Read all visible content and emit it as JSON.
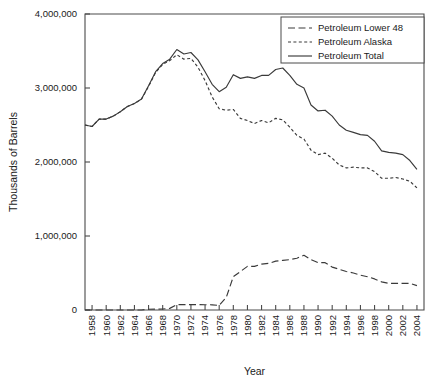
{
  "chart_data": {
    "type": "line",
    "title": "",
    "xlabel": "Year",
    "ylabel": "Thousands of Barrels",
    "xlim": [
      1957,
      2005
    ],
    "ylim": [
      0,
      4000000
    ],
    "grid": false,
    "legend_position": "top-right",
    "ytick_labels": [
      "0",
      "1,000,000",
      "2,000,000",
      "3,000,000",
      "4,000,000"
    ],
    "ytick_values": [
      0,
      1000000,
      2000000,
      3000000,
      4000000
    ],
    "xtick_labels": [
      "1958",
      "1960",
      "1962",
      "1964",
      "1966",
      "1968",
      "1970",
      "1972",
      "1974",
      "1976",
      "1978",
      "1980",
      "1982",
      "1984",
      "1986",
      "1988",
      "1990",
      "1992",
      "1994",
      "1996",
      "1998",
      "2000",
      "2002",
      "2004"
    ],
    "xtick_values": [
      1958,
      1960,
      1962,
      1964,
      1966,
      1968,
      1970,
      1972,
      1974,
      1976,
      1978,
      1980,
      1982,
      1984,
      1986,
      1988,
      1990,
      1992,
      1994,
      1996,
      1998,
      2000,
      2002,
      2004
    ],
    "x": [
      1957,
      1958,
      1959,
      1960,
      1961,
      1962,
      1963,
      1964,
      1965,
      1966,
      1967,
      1968,
      1969,
      1970,
      1971,
      1972,
      1973,
      1974,
      1975,
      1976,
      1977,
      1978,
      1979,
      1980,
      1981,
      1982,
      1983,
      1984,
      1985,
      1986,
      1987,
      1988,
      1989,
      1990,
      1991,
      1992,
      1993,
      1994,
      1995,
      1996,
      1997,
      1998,
      1999,
      2000,
      2001,
      2002,
      2003,
      2004
    ],
    "series": [
      {
        "name": "Petroleum Total",
        "dash": "solid",
        "values": [
          2500000,
          2480000,
          2580000,
          2580000,
          2620000,
          2680000,
          2750000,
          2790000,
          2850000,
          3030000,
          3220000,
          3330000,
          3390000,
          3520000,
          3460000,
          3480000,
          3380000,
          3220000,
          3050000,
          2950000,
          3010000,
          3180000,
          3130000,
          3150000,
          3130000,
          3170000,
          3170000,
          3250000,
          3270000,
          3170000,
          3050000,
          3000000,
          2770000,
          2690000,
          2700000,
          2620000,
          2500000,
          2430000,
          2400000,
          2370000,
          2360000,
          2280000,
          2150000,
          2130000,
          2120000,
          2100000,
          2020000,
          1900000
        ]
      },
      {
        "name": "Petroleum Lower 48",
        "dash": "dashed",
        "values": [
          2500000,
          2480000,
          2580000,
          2580000,
          2620000,
          2680000,
          2750000,
          2790000,
          2850000,
          3020000,
          3210000,
          3320000,
          3370000,
          3450000,
          3390000,
          3400000,
          3280000,
          3100000,
          2880000,
          2720000,
          2700000,
          2710000,
          2590000,
          2560000,
          2520000,
          2560000,
          2530000,
          2590000,
          2570000,
          2470000,
          2360000,
          2310000,
          2160000,
          2100000,
          2120000,
          2050000,
          1960000,
          1920000,
          1930000,
          1920000,
          1920000,
          1870000,
          1780000,
          1780000,
          1790000,
          1770000,
          1740000,
          1650000
        ]
      },
      {
        "name": "Petroleum Alaska",
        "dash": "longdash",
        "values": [
          0,
          0,
          0,
          0,
          0,
          0,
          0,
          0,
          0,
          10000,
          11000,
          13000,
          22000,
          72000,
          72000,
          73000,
          73000,
          71000,
          70000,
          62000,
          170000,
          450000,
          520000,
          590000,
          590000,
          620000,
          630000,
          660000,
          670000,
          680000,
          700000,
          740000,
          680000,
          640000,
          640000,
          580000,
          550000,
          520000,
          500000,
          470000,
          450000,
          420000,
          380000,
          360000,
          360000,
          360000,
          360000,
          330000
        ]
      }
    ]
  },
  "legend": {
    "items": [
      {
        "label": "Petroleum Lower 48",
        "dash": "longdash"
      },
      {
        "label": "Petroleum Alaska",
        "dash": "dashed"
      },
      {
        "label": "Petroleum Total",
        "dash": "solid"
      }
    ]
  }
}
